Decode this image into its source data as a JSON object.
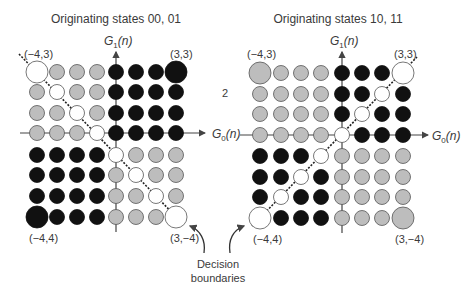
{
  "colors": {
    "black": "#111111",
    "gray": "#bdbdbd",
    "white": "#ffffff",
    "outline": "#555555",
    "axis": "#444444"
  },
  "panels": [
    {
      "title": "Originating states 00, 01",
      "y_axis_label": "G",
      "y_axis_sub": "1",
      "y_axis_arg": "(n)",
      "x_axis_label": "G",
      "x_axis_sub": "0",
      "x_axis_arg": "(n)",
      "corner_labels": {
        "top_left": "(−4,3)",
        "top_right": "(3,3)",
        "bottom_left": "(−4,4)",
        "bottom_right": "(3,−4)"
      },
      "boundary_direction": "descending",
      "grid": [
        [
          "W",
          "G",
          "G",
          "G",
          "B",
          "B",
          "B",
          "B"
        ],
        [
          "G",
          "W",
          "G",
          "G",
          "B",
          "B",
          "B",
          "B"
        ],
        [
          "G",
          "G",
          "W",
          "G",
          "B",
          "B",
          "B",
          "B"
        ],
        [
          "G",
          "G",
          "G",
          "W",
          "B",
          "B",
          "B",
          "B"
        ],
        [
          "B",
          "B",
          "B",
          "B",
          "W",
          "G",
          "G",
          "G"
        ],
        [
          "B",
          "B",
          "B",
          "B",
          "G",
          "W",
          "G",
          "G"
        ],
        [
          "B",
          "B",
          "B",
          "B",
          "G",
          "G",
          "W",
          "G"
        ],
        [
          "B",
          "B",
          "B",
          "B",
          "G",
          "G",
          "G",
          "W"
        ]
      ],
      "large_points": [
        [
          0,
          0
        ],
        [
          0,
          7
        ],
        [
          7,
          0
        ],
        [
          7,
          7
        ]
      ]
    },
    {
      "title": "Originating states 10, 11",
      "y_axis_label": "G",
      "y_axis_sub": "1",
      "y_axis_arg": "(n)",
      "x_axis_label": "G",
      "x_axis_sub": "0",
      "x_axis_arg": "(n)",
      "corner_labels": {
        "top_left": "(−4,3)",
        "top_right": "(3,3)",
        "bottom_left": "(−4,4)",
        "bottom_right": "(3,−4)"
      },
      "boundary_direction": "ascending",
      "grid": [
        [
          "G",
          "G",
          "G",
          "G",
          "B",
          "B",
          "B",
          "W"
        ],
        [
          "G",
          "G",
          "G",
          "G",
          "B",
          "B",
          "W",
          "B"
        ],
        [
          "G",
          "G",
          "G",
          "G",
          "B",
          "W",
          "B",
          "B"
        ],
        [
          "G",
          "G",
          "G",
          "G",
          "W",
          "B",
          "B",
          "B"
        ],
        [
          "B",
          "B",
          "B",
          "W",
          "G",
          "G",
          "G",
          "G"
        ],
        [
          "B",
          "B",
          "W",
          "B",
          "G",
          "G",
          "G",
          "G"
        ],
        [
          "B",
          "W",
          "B",
          "B",
          "G",
          "G",
          "G",
          "G"
        ],
        [
          "W",
          "B",
          "B",
          "B",
          "G",
          "G",
          "G",
          "G"
        ]
      ],
      "large_points": [
        [
          0,
          0
        ],
        [
          0,
          7
        ],
        [
          7,
          0
        ],
        [
          7,
          7
        ]
      ]
    }
  ],
  "middle_label": "2",
  "annotation": {
    "line1": "Decision",
    "line2": "boundaries"
  }
}
